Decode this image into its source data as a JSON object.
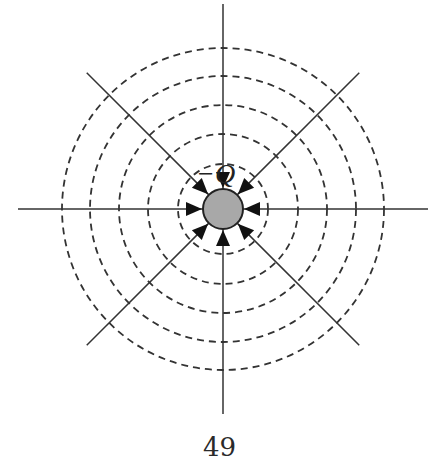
{
  "figure": {
    "charge_label": "−Q",
    "charge_sign": "negative",
    "center": [
      223,
      209
    ],
    "sphere_radius": 20,
    "equipotential_radii": [
      45,
      75,
      104,
      133,
      161
    ],
    "field_line_count": 8,
    "field_line_direction": "inward",
    "colors": {
      "line": "#333333",
      "sphere_fill": "#a8a8a8",
      "sphere_stroke": "#222222",
      "dashed": "#333333"
    }
  },
  "page": {
    "number": "49"
  }
}
